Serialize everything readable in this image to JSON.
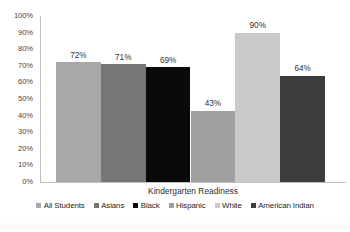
{
  "chart_data": {
    "type": "bar",
    "title": "",
    "xlabel": "Kindergarten Readiness",
    "ylabel": "",
    "categories": [
      "All Students",
      "Asians",
      "Black",
      "Hispanic",
      "White",
      "American Indian"
    ],
    "values": [
      72,
      71,
      69,
      43,
      90,
      64
    ],
    "value_labels": [
      "72%",
      "71%",
      "69%",
      "43%",
      "90%",
      "64%"
    ],
    "ylim": [
      0,
      100
    ],
    "ytick_values": [
      0,
      10,
      20,
      30,
      40,
      50,
      60,
      70,
      80,
      90,
      100
    ],
    "ytick_labels": [
      "0%",
      "10%",
      "20%",
      "30%",
      "40%",
      "50%",
      "60%",
      "70%",
      "80%",
      "90%",
      "100%"
    ],
    "grid": false,
    "legend_position": "bottom",
    "series_colors": [
      "#a8a8a8",
      "#767676",
      "#0a0a0a",
      "#a0a0a0",
      "#c9c9c9",
      "#3c3c3c"
    ],
    "legend": [
      {
        "label": "All Students",
        "color": "#a8a8a8"
      },
      {
        "label": "Asians",
        "color": "#767676"
      },
      {
        "label": "Black",
        "color": "#0a0a0a"
      },
      {
        "label": "Hispanic",
        "color": "#a0a0a0"
      },
      {
        "label": "White",
        "color": "#c9c9c9"
      },
      {
        "label": "American Indian",
        "color": "#3c3c3c"
      }
    ]
  },
  "axis": {
    "line_color": "#bfbfbf"
  }
}
